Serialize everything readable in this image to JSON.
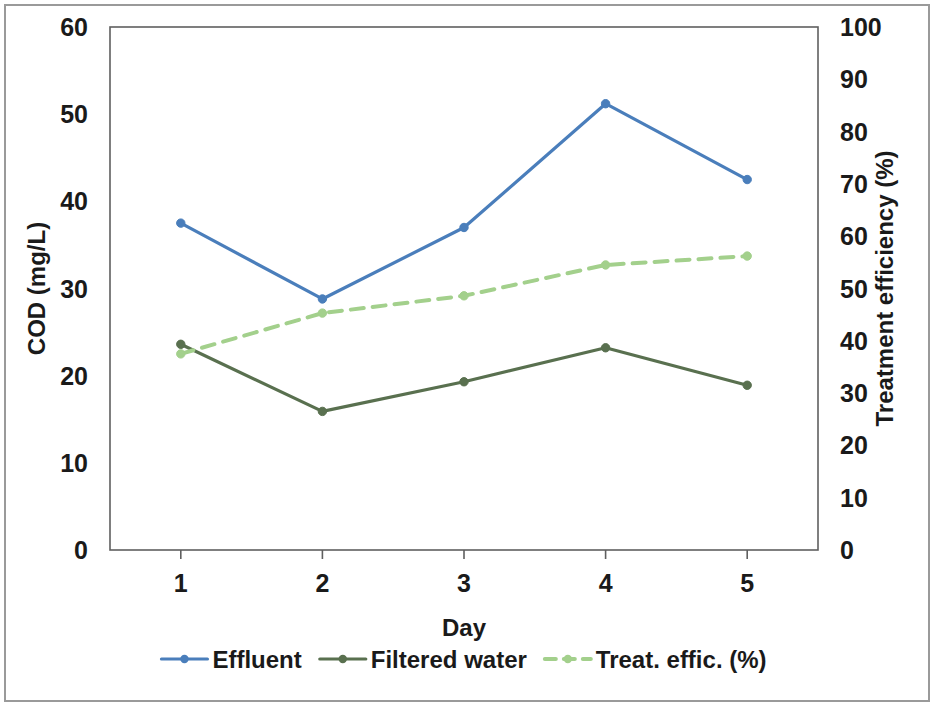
{
  "chart_data": {
    "type": "line",
    "title": "",
    "xlabel": "Day",
    "ylabel": "COD (mg/L)",
    "y2label": "Treatment efficiency (%)",
    "categories": [
      "1",
      "2",
      "3",
      "4",
      "5"
    ],
    "x": [
      1,
      2,
      3,
      4,
      5
    ],
    "ylim": [
      0,
      60
    ],
    "y2lim": [
      0,
      100
    ],
    "yticks": [
      "0",
      "10",
      "20",
      "30",
      "40",
      "50",
      "60"
    ],
    "y2ticks": [
      "0",
      "10",
      "20",
      "30",
      "40",
      "50",
      "60",
      "70",
      "80",
      "90",
      "100"
    ],
    "xticks": [
      "1",
      "2",
      "3",
      "4",
      "5"
    ],
    "grid": false,
    "legend_position": "bottom",
    "series": [
      {
        "name": "Effluent",
        "axis": "left",
        "color": "#4A7EBB",
        "style": "solid",
        "marker": "circle",
        "values": [
          37.5,
          28.8,
          37.0,
          51.2,
          42.5
        ]
      },
      {
        "name": "Filtered water",
        "axis": "left",
        "color": "#59704F",
        "style": "solid",
        "marker": "circle",
        "values": [
          23.6,
          15.9,
          19.3,
          23.2,
          18.9
        ]
      },
      {
        "name": "Treat. effic. (%)",
        "axis": "right",
        "color": "#A3D08C",
        "style": "dashed",
        "marker": "circle",
        "values": [
          37.5,
          45.3,
          48.6,
          54.5,
          56.2
        ]
      }
    ]
  },
  "legend": {
    "items": [
      {
        "label": "Effluent"
      },
      {
        "label": "Filtered water"
      },
      {
        "label": "Treat. effic. (%)"
      }
    ]
  },
  "colors": {
    "effluent": "#4A7EBB",
    "filtered_water": "#59704F",
    "treatment_efficiency": "#A3D08C",
    "axis": "#5f5f5f",
    "frame": "#9a9a9a",
    "text": "#1a1a1a"
  }
}
